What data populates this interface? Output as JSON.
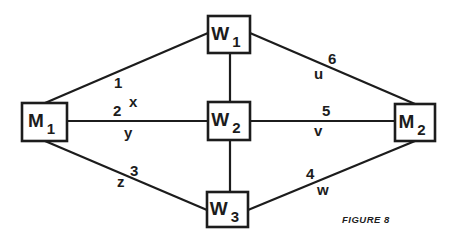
{
  "caption": "FIGURE 8",
  "colors": {
    "ink": "#1c1c1c",
    "background": "#ffffff"
  },
  "nodes": [
    {
      "id": "M1",
      "main": "M",
      "sub": "1",
      "x": 22,
      "y": 103,
      "w": 45,
      "h": 38
    },
    {
      "id": "W1",
      "main": "W",
      "sub": "1",
      "x": 208,
      "y": 16,
      "w": 42,
      "h": 37
    },
    {
      "id": "W2",
      "main": "W",
      "sub": "2",
      "x": 208,
      "y": 102,
      "w": 42,
      "h": 38
    },
    {
      "id": "W3",
      "main": "W",
      "sub": "3",
      "x": 207,
      "y": 192,
      "w": 41,
      "h": 35
    },
    {
      "id": "M2",
      "main": "M",
      "sub": "2",
      "x": 395,
      "y": 104,
      "w": 40,
      "h": 37
    }
  ],
  "edges": [
    {
      "number": "1",
      "variable": "x",
      "from": "M1",
      "to": "W1",
      "x1": 45,
      "y1": 103,
      "x2": 208,
      "y2": 33,
      "num_pos": [
        114,
        88
      ],
      "var_pos": [
        129,
        107
      ]
    },
    {
      "number": "2",
      "variable": "y",
      "from": "M1",
      "to": "W2",
      "x1": 67,
      "y1": 121,
      "x2": 208,
      "y2": 121,
      "num_pos": [
        113,
        116
      ],
      "var_pos": [
        124,
        138
      ]
    },
    {
      "number": "3",
      "variable": "z",
      "from": "M1",
      "to": "W3",
      "x1": 45,
      "y1": 141,
      "x2": 207,
      "y2": 210,
      "num_pos": [
        130,
        176
      ],
      "var_pos": [
        117,
        187
      ]
    },
    {
      "number": "4",
      "variable": "w",
      "from": "W3",
      "to": "M2",
      "x1": 248,
      "y1": 210,
      "x2": 415,
      "y2": 141,
      "num_pos": [
        306,
        179
      ],
      "var_pos": [
        317,
        195
      ]
    },
    {
      "number": "5",
      "variable": "v",
      "from": "W2",
      "to": "M2",
      "x1": 250,
      "y1": 121,
      "x2": 395,
      "y2": 121,
      "num_pos": [
        322,
        116
      ],
      "var_pos": [
        314,
        136
      ]
    },
    {
      "number": "6",
      "variable": "u",
      "from": "W1",
      "to": "M2",
      "x1": 250,
      "y1": 33,
      "x2": 415,
      "y2": 104,
      "num_pos": [
        328,
        64
      ],
      "var_pos": [
        314,
        79
      ]
    }
  ],
  "connectors": [
    {
      "from": "W1",
      "to": "W2",
      "x1": 230,
      "y1": 53,
      "x2": 230,
      "y2": 102
    },
    {
      "from": "W2",
      "to": "W3",
      "x1": 230,
      "y1": 140,
      "x2": 230,
      "y2": 192
    }
  ],
  "caption_pos": [
    342,
    223
  ]
}
